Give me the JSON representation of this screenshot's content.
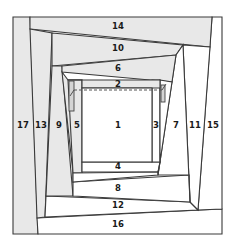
{
  "diagram": {
    "type": "foundation-pieced log-cabin spiral",
    "colors": {
      "line": "#3a3a3a",
      "shaded_piece": "#e8e8e8",
      "unshaded_piece": "#ffffff"
    },
    "pieces": [
      {
        "id": 1,
        "label": "1",
        "shade": "white"
      },
      {
        "id": 2,
        "label": "2",
        "shade": "gray"
      },
      {
        "id": 3,
        "label": "3",
        "shade": "white"
      },
      {
        "id": 4,
        "label": "4",
        "shade": "white"
      },
      {
        "id": 5,
        "label": "5",
        "shade": "gray"
      },
      {
        "id": 6,
        "label": "6",
        "shade": "gray"
      },
      {
        "id": 7,
        "label": "7",
        "shade": "white"
      },
      {
        "id": 8,
        "label": "8",
        "shade": "white"
      },
      {
        "id": 9,
        "label": "9",
        "shade": "gray"
      },
      {
        "id": 10,
        "label": "10",
        "shade": "gray"
      },
      {
        "id": 11,
        "label": "11",
        "shade": "white"
      },
      {
        "id": 12,
        "label": "12",
        "shade": "white"
      },
      {
        "id": 13,
        "label": "13",
        "shade": "gray"
      },
      {
        "id": 14,
        "label": "14",
        "shade": "gray"
      },
      {
        "id": 15,
        "label": "15",
        "shade": "white"
      },
      {
        "id": 16,
        "label": "16",
        "shade": "white"
      },
      {
        "id": 17,
        "label": "17",
        "shade": "gray"
      }
    ],
    "labels": {
      "p1": "1",
      "p2": "2",
      "p3": "3",
      "p4": "4",
      "p5": "5",
      "p6": "6",
      "p7": "7",
      "p8": "8",
      "p9": "9",
      "p10": "10",
      "p11": "11",
      "p12": "12",
      "p13": "13",
      "p14": "14",
      "p15": "15",
      "p16": "16",
      "p17": "17"
    }
  }
}
